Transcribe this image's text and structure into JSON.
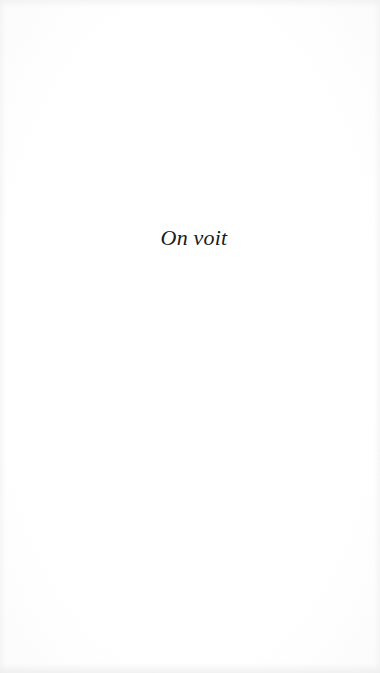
{
  "page": {
    "text": "On voit",
    "background_color": "#ffffff",
    "text_color": "#1a1a1a"
  }
}
